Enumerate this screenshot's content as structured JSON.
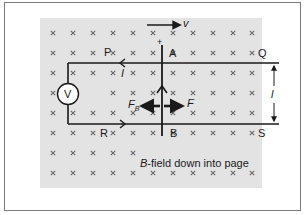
{
  "diagram": {
    "field_caption": {
      "symbol": "B",
      "text": "-field down into page"
    },
    "field_symbol": "×",
    "grid": {
      "columns": [
        53,
        73,
        93,
        113,
        133,
        153,
        173,
        193,
        213,
        233,
        252
      ],
      "rows": [
        33,
        53,
        73,
        93,
        113,
        133,
        153,
        173
      ]
    },
    "points": {
      "P": "P",
      "Q": "Q",
      "R": "R",
      "S": "S",
      "A": "A",
      "B": "B"
    },
    "rod_top_sign": "+",
    "velocity_label": "v",
    "current_label_top": "I",
    "current_label_right": "l",
    "force_label": "F",
    "magnetic_force_label": {
      "base": "F",
      "subscript": "B"
    },
    "meter_label": "V",
    "colors": {
      "field_background": "#e3e3e3",
      "frame_border": "#7a7a7a",
      "ink": "#1a1a1a",
      "cross": "#6a6a6a"
    }
  }
}
